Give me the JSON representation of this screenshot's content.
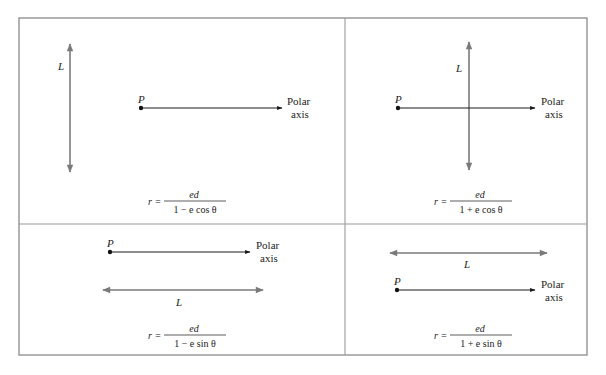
{
  "figure": {
    "colors": {
      "frame": "#8a8a8a",
      "directrix": "#7a7a7a",
      "axis": "#1a1a1a",
      "text": "#222222"
    },
    "panels": [
      {
        "id": "a",
        "directrix_label": "L",
        "pole_label": "P",
        "axis_label_line1": "Polar",
        "axis_label_line2": "axis",
        "directrix_orientation": "vertical, left of pole",
        "formula": {
          "lhs": "r =",
          "numerator": "ed",
          "denominator": "1 − e cos θ"
        }
      },
      {
        "id": "b",
        "directrix_label": "L",
        "pole_label": "P",
        "axis_label_line1": "Polar",
        "axis_label_line2": "axis",
        "directrix_orientation": "vertical, right of pole",
        "formula": {
          "lhs": "r =",
          "numerator": "ed",
          "denominator": "1 + e cos θ"
        }
      },
      {
        "id": "c",
        "directrix_label": "L",
        "pole_label": "P",
        "axis_label_line1": "Polar",
        "axis_label_line2": "axis",
        "directrix_orientation": "horizontal, below pole",
        "formula": {
          "lhs": "r =",
          "numerator": "ed",
          "denominator": "1 − e sin θ"
        }
      },
      {
        "id": "d",
        "directrix_label": "L",
        "pole_label": "P",
        "axis_label_line1": "Polar",
        "axis_label_line2": "axis",
        "directrix_orientation": "horizontal, above pole",
        "formula": {
          "lhs": "r =",
          "numerator": "ed",
          "denominator": "1 + e sin θ"
        }
      }
    ]
  }
}
